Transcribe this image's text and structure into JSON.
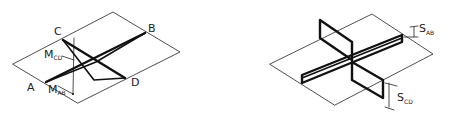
{
  "left_diagram": {
    "description": "Two crossing members AB and CD drawn over an inclined plane",
    "points": {
      "a": "A",
      "b": "B",
      "c": "C",
      "d": "D"
    },
    "labels": {
      "m_cd_main": "M",
      "m_cd_sub": "CD",
      "m_ab_main": "M",
      "m_ab_sub": "AB"
    }
  },
  "right_diagram": {
    "description": "Two crossing vertical panels with separation dimensions",
    "labels": {
      "s_ab_main": "S",
      "s_ab_sub": "AB",
      "s_cd_main": "S",
      "s_cd_sub": "CD"
    }
  },
  "colors": {
    "ink": "#111111",
    "background": "#ffffff"
  }
}
